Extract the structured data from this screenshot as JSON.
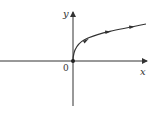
{
  "diagram": {
    "type": "function-graph",
    "x_axis_label": "x",
    "y_axis_label": "y",
    "origin_label": "0",
    "curve": "y = sqrt(x) shape starting at origin, with direction arrows pointing right",
    "colors": {
      "axes": "#333333",
      "curve": "#333333",
      "background": "#ffffff"
    }
  }
}
